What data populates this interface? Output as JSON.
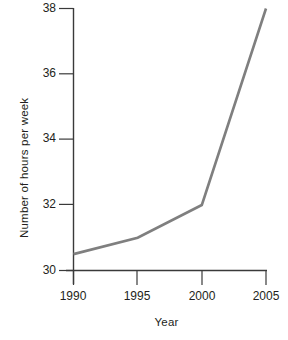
{
  "chart_data": {
    "type": "line",
    "title": "",
    "subtitle": "",
    "xlabel": "Year",
    "ylabel": "Number of hours per week",
    "x": [
      1990,
      1995,
      2000,
      2005
    ],
    "categories": [
      "1990",
      "1995",
      "2000",
      "2005"
    ],
    "values": [
      30.5,
      31,
      32,
      38
    ],
    "series": [
      {
        "name": "Number of hours per week",
        "values": [
          30.5,
          31,
          32,
          38
        ]
      }
    ],
    "xlim": [
      1990,
      2005
    ],
    "ylim": [
      30,
      38
    ],
    "x_ticks": [
      1990,
      1995,
      2000,
      2005
    ],
    "x_tick_labels": [
      "1990",
      "1995",
      "2000",
      "2005"
    ],
    "y_ticks": [
      30,
      32,
      34,
      36,
      38
    ],
    "y_tick_labels": [
      "30",
      "32",
      "34",
      "36",
      "38"
    ],
    "grid": false,
    "legend": "none",
    "markers": false,
    "line_color": "#7f7f7f",
    "axis_color": "#3a3a3a",
    "background_color": "#ffffff"
  }
}
